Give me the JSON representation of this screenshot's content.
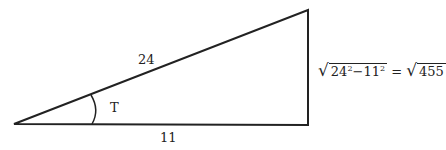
{
  "diagram": {
    "hypotenuse_label": "24",
    "base_label": "11",
    "angle_label": "T",
    "formula": {
      "radicand1_a": "24",
      "exp_a": "2",
      "minus": "−",
      "radicand1_b": "11",
      "exp_b": "2",
      "equals": "=",
      "radicand2": "455",
      "radical": "√"
    },
    "colors": {
      "stroke": "#222222",
      "background": "#ffffff"
    }
  }
}
